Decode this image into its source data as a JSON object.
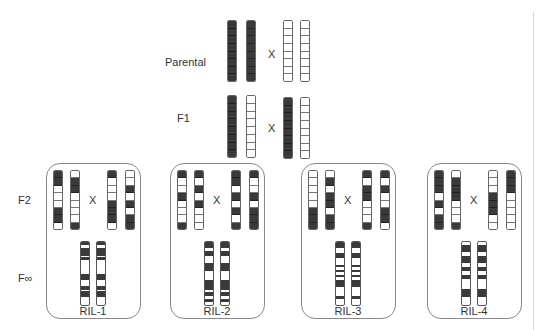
{
  "labels": {
    "parental": "Parental",
    "f1": "F1",
    "f2": "F2",
    "finf": "F∞",
    "cross": "X"
  },
  "colors": {
    "dark": "#3a3a3a",
    "light": "#ffffff",
    "border": "#888888"
  },
  "parental": {
    "left": [
      [
        1,
        1,
        1,
        1,
        1,
        1,
        1,
        1
      ],
      [
        1,
        1,
        1,
        1,
        1,
        1,
        1,
        1
      ]
    ],
    "right": [
      [
        0,
        0,
        0,
        0,
        0,
        0,
        0,
        0
      ],
      [
        0,
        0,
        0,
        0,
        0,
        0,
        0,
        0
      ]
    ]
  },
  "f1": {
    "left": [
      [
        1,
        1,
        1,
        1,
        1,
        1,
        1,
        1
      ],
      [
        0,
        0,
        0,
        0,
        0,
        0,
        0,
        0
      ]
    ],
    "right": [
      [
        1,
        1,
        1,
        1,
        1,
        1,
        1,
        1
      ],
      [
        0,
        0,
        0,
        0,
        0,
        0,
        0,
        0
      ]
    ]
  },
  "panels": [
    {
      "ril_label": "RIL-1",
      "f2": [
        [
          1,
          1,
          0,
          0,
          0,
          1,
          1,
          0
        ],
        [
          0,
          1,
          1,
          0,
          0,
          0,
          0,
          1
        ],
        [
          1,
          0,
          0,
          0,
          1,
          1,
          1,
          0
        ],
        [
          0,
          0,
          1,
          0,
          1,
          0,
          1,
          1
        ]
      ],
      "ril_bands": [
        [
          0,
          4
        ],
        [
          10,
          22
        ],
        [
          24,
          28
        ],
        [
          50,
          60
        ],
        [
          70,
          76
        ],
        [
          78,
          88
        ]
      ]
    },
    {
      "ril_label": "RIL-2",
      "f2": [
        [
          1,
          0,
          0,
          1,
          0,
          0,
          0,
          1
        ],
        [
          1,
          0,
          1,
          0,
          1,
          0,
          0,
          0
        ],
        [
          1,
          1,
          0,
          1,
          0,
          1,
          0,
          1
        ],
        [
          1,
          0,
          0,
          1,
          0,
          1,
          1,
          1
        ]
      ],
      "ril_bands": [
        [
          0,
          10
        ],
        [
          14,
          22
        ],
        [
          34,
          46
        ],
        [
          60,
          76
        ],
        [
          80,
          86
        ],
        [
          90,
          95
        ]
      ]
    },
    {
      "ril_label": "RIL-3",
      "f2": [
        [
          0,
          0,
          0,
          0,
          0,
          1,
          1,
          1
        ],
        [
          0,
          1,
          0,
          1,
          1,
          0,
          1,
          1
        ],
        [
          1,
          0,
          1,
          1,
          0,
          0,
          0,
          1
        ],
        [
          1,
          0,
          1,
          0,
          0,
          1,
          1,
          0
        ]
      ],
      "ril_bands": [
        [
          0,
          10
        ],
        [
          18,
          26
        ],
        [
          36,
          40
        ],
        [
          44,
          48
        ],
        [
          52,
          56
        ],
        [
          60,
          72
        ],
        [
          86,
          90
        ]
      ]
    },
    {
      "ril_label": "RIL-4",
      "f2": [
        [
          1,
          1,
          1,
          0,
          1,
          0,
          1,
          1
        ],
        [
          0,
          1,
          1,
          1,
          0,
          0,
          0,
          1
        ],
        [
          0,
          0,
          0,
          1,
          1,
          1,
          0,
          0
        ],
        [
          1,
          1,
          1,
          0,
          0,
          0,
          0,
          0
        ]
      ],
      "ril_bands": [
        [
          4,
          16
        ],
        [
          22,
          34
        ],
        [
          40,
          46
        ],
        [
          52,
          58
        ],
        [
          74,
          88
        ]
      ]
    }
  ]
}
